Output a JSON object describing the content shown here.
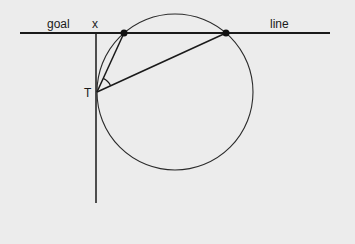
{
  "diagram": {
    "labels": {
      "goal": "goal",
      "x": "x",
      "line": "line",
      "T": "T"
    },
    "geometry": {
      "goal_line": {
        "x1": 20,
        "y1": 33,
        "x2": 330,
        "y2": 33
      },
      "vertical_line": {
        "x1": 96,
        "y1": 33,
        "x2": 96,
        "y2": 203
      },
      "circle": {
        "cx": 175,
        "cy": 92,
        "r": 78
      },
      "point_T": {
        "x": 97,
        "y": 92
      },
      "goalpost_near": {
        "x": 124,
        "y": 33
      },
      "goalpost_far": {
        "x": 226,
        "y": 33
      }
    },
    "colors": {
      "background": "#ececec",
      "stroke": "#1a1a1a"
    }
  }
}
